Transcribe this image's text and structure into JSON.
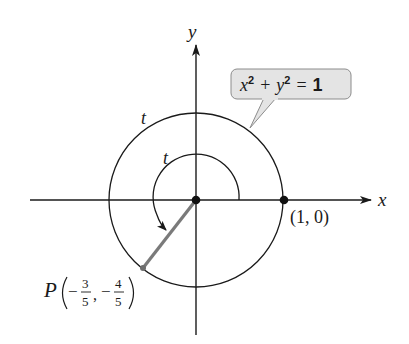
{
  "diagram": {
    "type": "unit-circle",
    "axes": {
      "x_label": "x",
      "y_label": "y"
    },
    "circle": {
      "equation_label": {
        "x_part": "x",
        "x_exp": "2",
        "plus": "+",
        "y_part": "y",
        "y_exp": "2",
        "equals": "=",
        "rhs": "1"
      },
      "equation_text": "x² + y² = 1"
    },
    "arc_labels": {
      "outer": "t",
      "inner": "t"
    },
    "points": {
      "start": {
        "label": "(1, 0)",
        "x": 1,
        "y": 0
      },
      "terminal": {
        "name": "P",
        "x_sign": "−",
        "x_num": "3",
        "x_den": "5",
        "comma": ",",
        "y_sign": "−",
        "y_num": "4",
        "y_den": "5",
        "x": -0.6,
        "y": -0.8
      }
    },
    "colors": {
      "line": "#1a1a1a",
      "radius_segment": "#7a7a7a",
      "label_box_fill": "#e4e4e4",
      "label_box_stroke": "#8c8c8c"
    }
  }
}
